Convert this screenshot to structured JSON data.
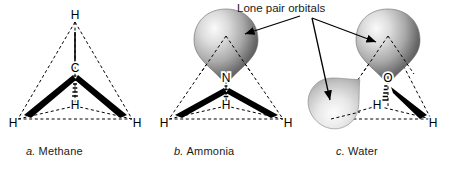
{
  "figure": {
    "annotation_label": "Lone pair orbitals",
    "panels": [
      {
        "index": "a.",
        "name": "Methane",
        "formula_center": "C",
        "atoms": [
          "H",
          "H",
          "H",
          "H"
        ],
        "lone_pairs": 0,
        "caption": "a. Methane"
      },
      {
        "index": "b.",
        "name": "Ammonia",
        "formula_center": "N",
        "atoms": [
          "H",
          "H",
          "H"
        ],
        "lone_pairs": 1,
        "caption": "b. Ammonia"
      },
      {
        "index": "c.",
        "name": "Water",
        "formula_center": "O",
        "atoms": [
          "H",
          "H"
        ],
        "lone_pairs": 2,
        "caption": "c. Water"
      }
    ],
    "colors": {
      "ink": "#000000",
      "background": "#ffffff",
      "orbital_light": "#f2f2f2",
      "orbital_mid": "#b8b8b8",
      "orbital_dark": "#4a4a4a"
    }
  }
}
